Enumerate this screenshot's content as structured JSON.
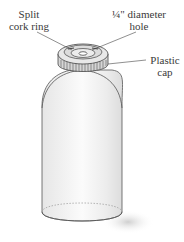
{
  "diagram": {
    "labels": {
      "split_cork_ring": {
        "line1": "Split",
        "line2": "cork ring"
      },
      "hole": {
        "line1": "¼\" diameter",
        "line2": "hole"
      },
      "plastic_cap": {
        "line1": "Plastic",
        "line2": "cap"
      }
    },
    "colors": {
      "outline": "#555555",
      "bottle_fill": "#f4f4f4",
      "cap_fill": "#e2e2e2",
      "shadow": "#d8d8d8",
      "text": "#3a3a3a"
    }
  }
}
